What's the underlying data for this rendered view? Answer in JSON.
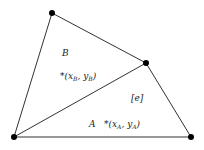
{
  "diagram": {
    "vertices": [
      {
        "id": "top",
        "x": 52,
        "y": 13
      },
      {
        "id": "right-mid",
        "x": 146,
        "y": 63
      },
      {
        "id": "bottom-left",
        "x": 14,
        "y": 137
      },
      {
        "id": "bottom-right",
        "x": 191,
        "y": 137
      }
    ],
    "labels": {
      "cell_b": "B",
      "centroid_b": "*(x_B, y_B)",
      "edge": "[e]",
      "cell_a": "A",
      "centroid_a": "*(x_A, y_A)"
    },
    "colors": {
      "line": "#333333",
      "vertex": "#000000",
      "text": "#222222"
    }
  }
}
